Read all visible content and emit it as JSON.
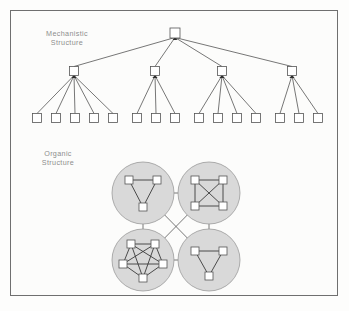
{
  "figure": {
    "background_color": "#fdfdfc",
    "border_color": "#6f6f6f",
    "width": 349,
    "height": 311
  },
  "labels": {
    "mechanistic": "Mechanistic\nStructure",
    "organic": "Organic\nStructure",
    "text_color": "#8d8d8d"
  },
  "diagram_data": {
    "type": "diagram",
    "title": "Mechanistic and Organic Organizational Structures",
    "node_shape": "square",
    "node_fill": "#ffffff",
    "node_stroke": "#555555",
    "mechanistic": {
      "label": "Mechanistic Structure",
      "description": "Hierarchical tree with one root, four managers, and fifteen leaf nodes",
      "node_size": 9,
      "levels": 3,
      "root": {
        "id": "root",
        "x": 175,
        "y": 33
      },
      "managers": [
        {
          "id": "m1",
          "x": 74,
          "y": 71,
          "leaf_count": 5
        },
        {
          "id": "m2",
          "x": 155,
          "y": 71,
          "leaf_count": 3
        },
        {
          "id": "m3",
          "x": 222,
          "y": 71,
          "leaf_count": 4
        },
        {
          "id": "m4",
          "x": 292,
          "y": 71,
          "leaf_count": 3
        }
      ],
      "leaf_row_y": 118,
      "leaves": [
        {
          "id": "l1",
          "x": 37,
          "parent": "m1"
        },
        {
          "id": "l2",
          "x": 56,
          "parent": "m1"
        },
        {
          "id": "l3",
          "x": 75,
          "parent": "m1"
        },
        {
          "id": "l4",
          "x": 94,
          "parent": "m1"
        },
        {
          "id": "l5",
          "x": 113,
          "parent": "m1"
        },
        {
          "id": "l6",
          "x": 137,
          "parent": "m2"
        },
        {
          "id": "l7",
          "x": 156,
          "parent": "m2"
        },
        {
          "id": "l8",
          "x": 175,
          "parent": "m2"
        },
        {
          "id": "l9",
          "x": 199,
          "parent": "m3"
        },
        {
          "id": "l10",
          "x": 218,
          "parent": "m3"
        },
        {
          "id": "l11",
          "x": 237,
          "parent": "m3"
        },
        {
          "id": "l12",
          "x": 256,
          "parent": "m3"
        },
        {
          "id": "l13",
          "x": 280,
          "parent": "m4"
        },
        {
          "id": "l14",
          "x": 299,
          "parent": "m4"
        },
        {
          "id": "l15",
          "x": 318,
          "parent": "m4"
        }
      ],
      "total_nodes": 20
    },
    "organic": {
      "label": "Organic Structure",
      "description": "Four interconnected clusters, each a fully connected network of nodes",
      "circle_fill": "#d9d9d9",
      "circle_stroke": "#9a9a9a",
      "circle_radius": 31,
      "node_size": 8,
      "clusters": [
        {
          "id": "c-top-left",
          "position": "top-left",
          "cx": 143,
          "cy": 193,
          "node_count": 3,
          "topology": "triangle",
          "nodes": [
            {
              "x": -14,
              "y": -13
            },
            {
              "x": 14,
              "y": -13
            },
            {
              "x": 0,
              "y": 14
            }
          ],
          "edges": [
            [
              0,
              1
            ],
            [
              0,
              2
            ],
            [
              1,
              2
            ]
          ]
        },
        {
          "id": "c-top-right",
          "position": "top-right",
          "cx": 209,
          "cy": 193,
          "node_count": 4,
          "topology": "complete-k4",
          "nodes": [
            {
              "x": -14,
              "y": -13
            },
            {
              "x": 14,
              "y": -13
            },
            {
              "x": -14,
              "y": 13
            },
            {
              "x": 14,
              "y": 13
            }
          ],
          "edges": [
            [
              0,
              1
            ],
            [
              0,
              2
            ],
            [
              0,
              3
            ],
            [
              1,
              2
            ],
            [
              1,
              3
            ],
            [
              2,
              3
            ]
          ]
        },
        {
          "id": "c-bottom-left",
          "position": "bottom-left",
          "cx": 143,
          "cy": 260,
          "node_count": 5,
          "topology": "complete-k5",
          "nodes": [
            {
              "x": -12,
              "y": -16
            },
            {
              "x": 12,
              "y": -16
            },
            {
              "x": -20,
              "y": 4
            },
            {
              "x": 20,
              "y": 4
            },
            {
              "x": 0,
              "y": 18
            }
          ],
          "edges": [
            [
              0,
              1
            ],
            [
              0,
              2
            ],
            [
              0,
              3
            ],
            [
              0,
              4
            ],
            [
              1,
              2
            ],
            [
              1,
              3
            ],
            [
              1,
              4
            ],
            [
              2,
              3
            ],
            [
              2,
              4
            ],
            [
              3,
              4
            ]
          ]
        },
        {
          "id": "c-bottom-right",
          "position": "bottom-right",
          "cx": 209,
          "cy": 260,
          "node_count": 3,
          "topology": "triangle",
          "nodes": [
            {
              "x": -14,
              "y": -9
            },
            {
              "x": 14,
              "y": -9
            },
            {
              "x": 0,
              "y": 16
            }
          ],
          "edges": [
            [
              0,
              1
            ],
            [
              0,
              2
            ],
            [
              1,
              2
            ]
          ]
        }
      ],
      "cluster_links": [
        {
          "from": "c-top-left",
          "to": "c-top-right",
          "kind": "horizontal"
        },
        {
          "from": "c-bottom-left",
          "to": "c-bottom-right",
          "kind": "horizontal"
        },
        {
          "from": "c-top-left",
          "to": "c-bottom-left",
          "kind": "vertical"
        },
        {
          "from": "c-top-right",
          "to": "c-bottom-right",
          "kind": "vertical"
        },
        {
          "from": "c-top-left",
          "to": "c-bottom-right",
          "kind": "diagonal"
        },
        {
          "from": "c-top-right",
          "to": "c-bottom-left",
          "kind": "diagonal"
        }
      ],
      "total_nodes": 15
    }
  }
}
